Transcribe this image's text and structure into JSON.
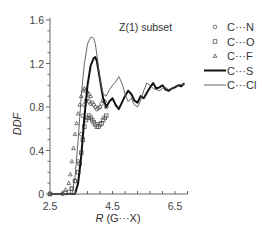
{
  "chart_data": {
    "type": "line",
    "title": "Z(1) subset",
    "xlabel": "R (G···X)",
    "ylabel": "DDF",
    "xlim": [
      2.5,
      6.9
    ],
    "ylim": [
      0,
      1.6
    ],
    "xticks": [
      "2.5",
      "4.5",
      "6.5"
    ],
    "yticks": [
      "0",
      "0.4",
      "0.8",
      "1.2",
      "1.6"
    ],
    "grid": false,
    "legend_position": "right",
    "series": [
      {
        "name": "C···N",
        "style": "circle-markers",
        "color": "#555555",
        "x": [
          2.5,
          2.9,
          3.1,
          3.2,
          3.3,
          3.4,
          3.5,
          3.55,
          3.6,
          3.65,
          3.7,
          3.75,
          3.8,
          3.85,
          3.9,
          3.95,
          4.0,
          4.05,
          4.1,
          4.15,
          4.2,
          4.25,
          4.3
        ],
        "y": [
          0.0,
          0.0,
          0.02,
          0.05,
          0.12,
          0.3,
          0.55,
          0.72,
          0.82,
          0.86,
          0.88,
          0.85,
          0.83,
          0.84,
          0.82,
          0.8,
          0.78,
          0.79,
          0.8,
          0.83,
          0.86,
          0.85,
          0.8
        ]
      },
      {
        "name": "C···O",
        "style": "square-markers",
        "color": "#555555",
        "x": [
          2.5,
          3.0,
          3.2,
          3.3,
          3.4,
          3.45,
          3.5,
          3.55,
          3.6,
          3.65,
          3.7,
          3.75,
          3.8,
          3.85,
          3.9,
          3.95,
          4.0,
          4.05,
          4.1,
          4.15,
          4.2,
          4.25,
          4.3
        ],
        "y": [
          0.0,
          0.01,
          0.05,
          0.12,
          0.2,
          0.28,
          0.38,
          0.5,
          0.62,
          0.68,
          0.7,
          0.72,
          0.7,
          0.68,
          0.66,
          0.64,
          0.62,
          0.62,
          0.64,
          0.65,
          0.68,
          0.7,
          0.72
        ]
      },
      {
        "name": "C···F",
        "style": "triangle-markers",
        "color": "#555555",
        "x": [
          2.5,
          2.9,
          3.0,
          3.1,
          3.15,
          3.2,
          3.25,
          3.3,
          3.35,
          3.4,
          3.45,
          3.5,
          3.55,
          3.6,
          3.65,
          3.7,
          3.75,
          3.8
        ],
        "y": [
          0.0,
          0.01,
          0.04,
          0.1,
          0.18,
          0.3,
          0.42,
          0.55,
          0.65,
          0.74,
          0.82,
          0.9,
          0.95,
          0.97,
          0.96,
          0.94,
          0.92,
          0.9
        ]
      },
      {
        "name": "C···S",
        "style": "thick-line",
        "color": "#111111",
        "x": [
          2.5,
          3.3,
          3.4,
          3.5,
          3.6,
          3.7,
          3.8,
          3.9,
          3.95,
          4.0,
          4.1,
          4.2,
          4.3,
          4.4,
          4.5,
          4.6,
          4.7,
          4.8,
          4.9,
          5.0,
          5.1,
          5.2,
          5.3,
          5.4,
          5.5,
          5.6,
          5.7,
          5.8,
          5.9,
          6.0,
          6.1,
          6.2,
          6.3,
          6.4,
          6.5,
          6.6,
          6.7,
          6.8
        ],
        "y": [
          0.0,
          0.0,
          0.1,
          0.35,
          0.7,
          1.0,
          1.18,
          1.25,
          1.26,
          1.22,
          1.05,
          0.88,
          0.8,
          0.85,
          0.88,
          0.82,
          0.78,
          0.84,
          0.9,
          0.95,
          0.92,
          0.86,
          0.84,
          0.9,
          0.88,
          0.93,
          0.98,
          1.02,
          0.97,
          0.98,
          1.0,
          0.96,
          0.95,
          0.97,
          0.98,
          1.0,
          0.99,
          1.02
        ]
      },
      {
        "name": "C···Cl",
        "style": "thin-line",
        "color": "#555555",
        "x": [
          2.5,
          3.2,
          3.3,
          3.4,
          3.5,
          3.6,
          3.7,
          3.8,
          3.85,
          3.9,
          3.95,
          4.0,
          4.1,
          4.2,
          4.3,
          4.4,
          4.5,
          4.6,
          4.7,
          4.8,
          4.9,
          5.0,
          5.1,
          5.2,
          5.3,
          5.4,
          5.5,
          5.6,
          5.7,
          5.8,
          5.9,
          6.0,
          6.1,
          6.2,
          6.3,
          6.4,
          6.5,
          6.6,
          6.7,
          6.8
        ],
        "y": [
          0.0,
          0.0,
          0.15,
          0.5,
          0.9,
          1.2,
          1.38,
          1.44,
          1.44,
          1.43,
          1.38,
          1.28,
          1.05,
          0.92,
          0.9,
          0.96,
          1.0,
          1.03,
          1.08,
          1.02,
          0.92,
          0.85,
          0.88,
          0.82,
          0.8,
          0.86,
          0.95,
          1.02,
          1.0,
          0.97,
          0.96,
          0.95,
          0.97,
          0.98,
          0.96,
          0.97,
          0.99,
          1.0,
          1.01,
          1.0
        ]
      }
    ]
  },
  "legend": [
    {
      "label": "C···N",
      "marker": "circle"
    },
    {
      "label": "C···O",
      "marker": "square"
    },
    {
      "label": "C···F",
      "marker": "triangle"
    },
    {
      "label": "C···S",
      "marker": "thick-line"
    },
    {
      "label": "C···Cl",
      "marker": "thin-line"
    }
  ]
}
